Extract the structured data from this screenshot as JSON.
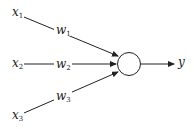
{
  "diagram": {
    "type": "perceptron",
    "inputs": [
      {
        "label": "x",
        "sub": "1"
      },
      {
        "label": "x",
        "sub": "2"
      },
      {
        "label": "x",
        "sub": "3"
      }
    ],
    "weights": [
      {
        "label": "w",
        "sub": "1"
      },
      {
        "label": "w",
        "sub": "2"
      },
      {
        "label": "w",
        "sub": "3"
      }
    ],
    "output": {
      "label": "y"
    },
    "colors": {
      "stroke": "#222222",
      "background": "#ffffff"
    }
  }
}
